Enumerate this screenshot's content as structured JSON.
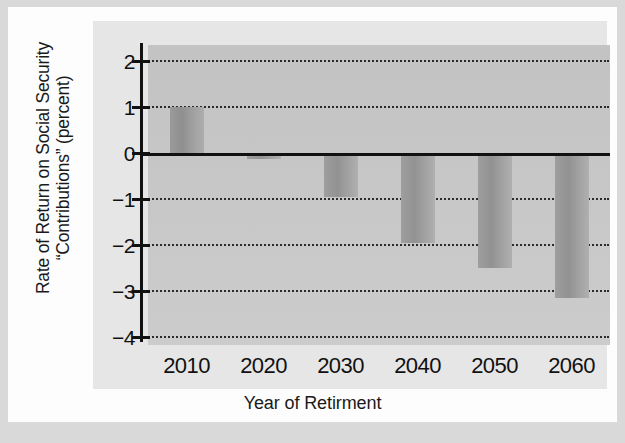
{
  "chart_data": {
    "type": "bar",
    "title": "",
    "xlabel": "Year of Retirment",
    "ylabel_line1": "Rate of Return on Social Security",
    "ylabel_line2": "“Contributions” (percent)",
    "categories": [
      "2010",
      "2020",
      "2030",
      "2040",
      "2050",
      "2060"
    ],
    "values": [
      1.0,
      -0.13,
      -0.95,
      -1.95,
      -2.5,
      -3.15
    ],
    "series": [
      {
        "name": "Rate of Return on Social Security Contributions",
        "values": [
          1.0,
          -0.13,
          -0.95,
          -1.95,
          -2.5,
          -3.15
        ]
      }
    ],
    "ylim": [
      -4,
      2.3
    ],
    "ytick_values": [
      2,
      1,
      0,
      -1,
      -2,
      -3,
      -4
    ],
    "ytick_labels": [
      "2",
      "1",
      "0",
      "−1",
      "−2",
      "−3",
      "−4"
    ],
    "grid": true,
    "grid_style": "dotted",
    "legend": null,
    "legend_position": "none",
    "zero_line": true,
    "bar_color": "#9a9a9a",
    "plot_bg": "#c9c9c9",
    "panel_bg": "#e6e6e6",
    "axis_color": "#111111"
  }
}
